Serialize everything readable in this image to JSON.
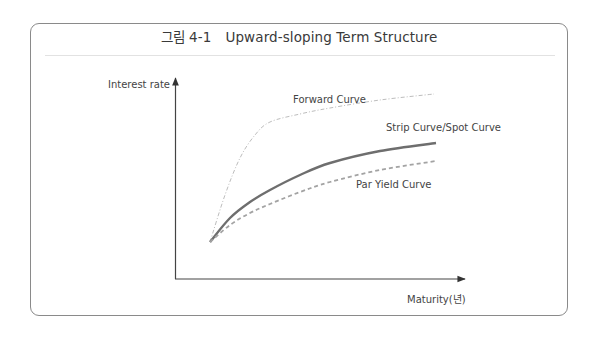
{
  "figure": {
    "title_prefix": "그림 4-1",
    "title_text": "Upward-sloping Term Structure"
  },
  "chart_data": {
    "type": "line",
    "title": "Upward-sloping Term Structure",
    "xlabel": "Maturity(년)",
    "ylabel": "Interest rate",
    "grid": false,
    "ticks": false,
    "legend_position": "inline labels",
    "series": [
      {
        "name": "Forward Curve",
        "style": "thin dash-dot, light gray",
        "color": "#b5b5b5",
        "points_px": [
          [
            210,
            242
          ],
          [
            225,
            195
          ],
          [
            240,
            158
          ],
          [
            255,
            135
          ],
          [
            270,
            122
          ],
          [
            300,
            114
          ],
          [
            330,
            108
          ],
          [
            380,
            100
          ],
          [
            434,
            94
          ]
        ]
      },
      {
        "name": "Strip Curve/Spot Curve",
        "style": "solid thick, dark gray",
        "color": "#6e6e6e",
        "points_px": [
          [
            210,
            242
          ],
          [
            230,
            218
          ],
          [
            250,
            202
          ],
          [
            270,
            190
          ],
          [
            300,
            175
          ],
          [
            330,
            163
          ],
          [
            380,
            151
          ],
          [
            436,
            143
          ]
        ]
      },
      {
        "name": "Par Yield Curve",
        "style": "dashed, medium gray",
        "color": "#a0a0a0",
        "points_px": [
          [
            210,
            242
          ],
          [
            230,
            225
          ],
          [
            250,
            213
          ],
          [
            270,
            204
          ],
          [
            300,
            192
          ],
          [
            330,
            182
          ],
          [
            380,
            170
          ],
          [
            436,
            161
          ]
        ]
      }
    ],
    "annotations": [
      "Forward Curve",
      "Strip Curve/Spot Curve",
      "Par Yield Curve"
    ]
  },
  "labels": {
    "y_axis": "Interest rate",
    "x_axis": "Maturity(년)",
    "forward": "Forward Curve",
    "strip": "Strip Curve/Spot Curve",
    "par": "Par Yield Curve"
  }
}
